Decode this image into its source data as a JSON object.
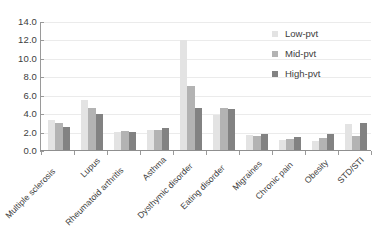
{
  "chart_data": {
    "type": "bar",
    "title": "",
    "xlabel": "",
    "ylabel": "",
    "ylim": [
      0.0,
      14.0
    ],
    "ytick_step": 2.0,
    "ytick_labels": [
      "0.0",
      "2.0",
      "4.0",
      "6.0",
      "8.0",
      "10.0",
      "12.0",
      "14.0"
    ],
    "grid": true,
    "legend_position": "top-right",
    "categories": [
      "Multiple sclerosis",
      "Lupus",
      "Rheumatoid arthritis",
      "Asthma",
      "Dysthymic disorder",
      "Eating disorder",
      "Migraines",
      "Chronic pain",
      "Obesity",
      "STD/STI"
    ],
    "series": [
      {
        "name": "Low-pvt",
        "color": "#e3e3e3",
        "values": [
          3.4,
          5.5,
          2.05,
          2.25,
          12.1,
          3.9,
          1.7,
          1.15,
          1.05,
          2.95
        ]
      },
      {
        "name": "Mid-pvt",
        "color": "#b3b3b3",
        "values": [
          3.05,
          4.7,
          2.15,
          2.3,
          7.05,
          4.7,
          1.6,
          1.35,
          1.4,
          1.65
        ]
      },
      {
        "name": "High-pvt",
        "color": "#828282",
        "values": [
          2.65,
          4.05,
          2.1,
          2.45,
          4.65,
          4.6,
          1.8,
          1.5,
          1.85,
          3.0
        ]
      }
    ]
  },
  "legend": {
    "items": [
      {
        "label": "Low-pvt"
      },
      {
        "label": "Mid-pvt"
      },
      {
        "label": "High-pvt"
      }
    ]
  },
  "axes": {
    "y_labels": [
      "14.0",
      "12.0",
      "10.0",
      "8.0",
      "6.0",
      "4.0",
      "2.0",
      "0.0"
    ]
  }
}
